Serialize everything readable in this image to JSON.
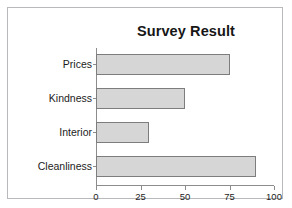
{
  "chart_data": {
    "type": "bar",
    "orientation": "horizontal",
    "title": "Survey Result",
    "xlabel": "",
    "ylabel": "",
    "categories": [
      "Prices",
      "Kindness",
      "Interior",
      "Cleanliness"
    ],
    "values": [
      75,
      50,
      30,
      90
    ],
    "xlim": [
      0,
      100
    ],
    "xticks": [
      0,
      25,
      50,
      75,
      100
    ],
    "xtick_labels": [
      "0",
      "25",
      "50",
      "75",
      "100"
    ],
    "grid": false,
    "legend": null,
    "series": [
      {
        "name": "Survey Result",
        "values": [
          75,
          50,
          30,
          90
        ]
      }
    ]
  },
  "style": {
    "bar_fill": "#d6d6d6",
    "bar_border": "#7d7d7d",
    "axis_color": "#8c8c8c",
    "text_color": "#1c1c1c",
    "title_color": "#161616",
    "frame_border": "#b9b9bd",
    "background": "#ffffff"
  }
}
